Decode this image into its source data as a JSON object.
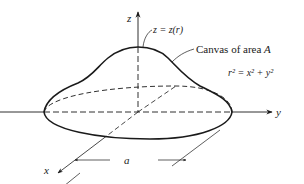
{
  "diagram": {
    "axes": {
      "x_label": "x",
      "y_label": "y",
      "z_label": "z"
    },
    "annotations": {
      "surface_label": "z = z(r)",
      "canvas_label_text": "Canvas of area ",
      "canvas_label_var": "A",
      "radius_relation": "r² = x² + y²",
      "dimension_label": "a"
    },
    "colors": {
      "ink": "#1a1a1a",
      "background": "#ffffff"
    }
  }
}
